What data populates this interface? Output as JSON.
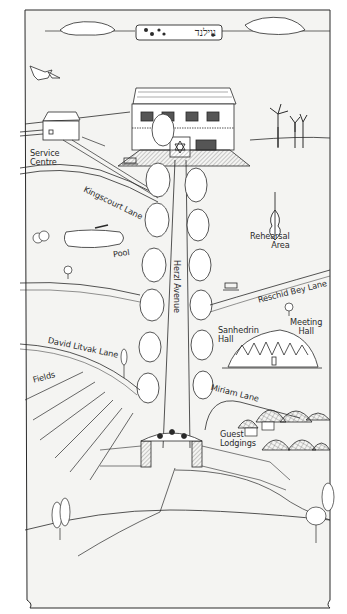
{
  "map": {
    "title_hebrew": "נוילנד",
    "labels": {
      "service_centre": "Service\nCentre",
      "kingscourt_lane": "Kingscourt Lane",
      "pool": "Pool",
      "herzl_avenue": "Herzl Avenue",
      "rehearsal_area": "Rehearsal\nArea",
      "reschid_bey_lane": "Reschid Bey Lane",
      "sanhedrin_hall": "Sanhedrin\nHall",
      "meeting_hall": "Meeting\nHall",
      "david_litvak_lane": "David Litvak Lane",
      "fields": "Fields",
      "miriam_lane": "Miriam Lane",
      "guest_lodgings": "Guest\nLodgings"
    },
    "icons": [
      "dove-icon",
      "cloud-icon",
      "wind-turbine-icon",
      "violin-icon",
      "bench-icon",
      "tree-icon",
      "star-of-david-icon",
      "gate-icon",
      "dome-hall-icon",
      "lodging-domes-icon"
    ],
    "colors": {
      "ink": "#2a2a2a",
      "paper": "#f4f4f2",
      "shade": "#d9d9d6"
    }
  }
}
